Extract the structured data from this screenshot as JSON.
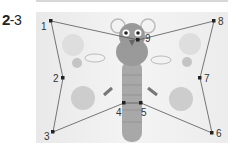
{
  "exercise": {
    "number": "2",
    "sub": "-3"
  },
  "dots": [
    {
      "label": "1",
      "x": 51,
      "y": 21
    },
    {
      "label": "2",
      "x": 63,
      "y": 78
    },
    {
      "label": "3",
      "x": 53,
      "y": 132
    },
    {
      "label": "4",
      "x": 124,
      "y": 103
    },
    {
      "label": "5",
      "x": 141,
      "y": 103
    },
    {
      "label": "6",
      "x": 212,
      "y": 133
    },
    {
      "label": "7",
      "x": 200,
      "y": 78
    },
    {
      "label": "8",
      "x": 214,
      "y": 21
    },
    {
      "label": "9",
      "x": 138,
      "y": 40
    }
  ],
  "colors": {
    "line": "#555555",
    "dot": "#222222",
    "circle": "#cfcfcf",
    "character": "#9a9a9a"
  }
}
